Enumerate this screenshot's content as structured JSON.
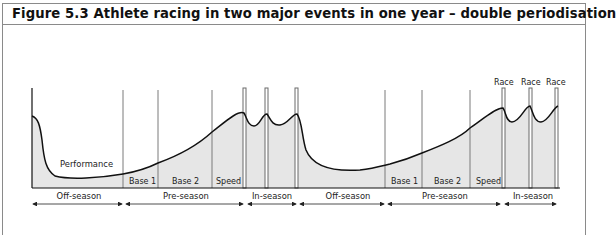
{
  "figure": {
    "title": "Figure 5.3 Athlete racing in two major events in one year – double periodisation"
  },
  "diagram": {
    "curve_label": "Performance",
    "phase_labels": [
      "Base 1",
      "Base 2",
      "Speed",
      "Base 1",
      "Base 2",
      "Speed"
    ],
    "race_labels": [
      "Race",
      "Race",
      "Race"
    ],
    "season_labels": [
      "Off-season",
      "Pre-season",
      "In-season",
      "Off-season",
      "Pre-season",
      "In-season"
    ],
    "colors": {
      "fill": "#e6e6e6",
      "line": "#111111",
      "divider": "#7a7a7a",
      "border": "#8a8a8a"
    }
  }
}
